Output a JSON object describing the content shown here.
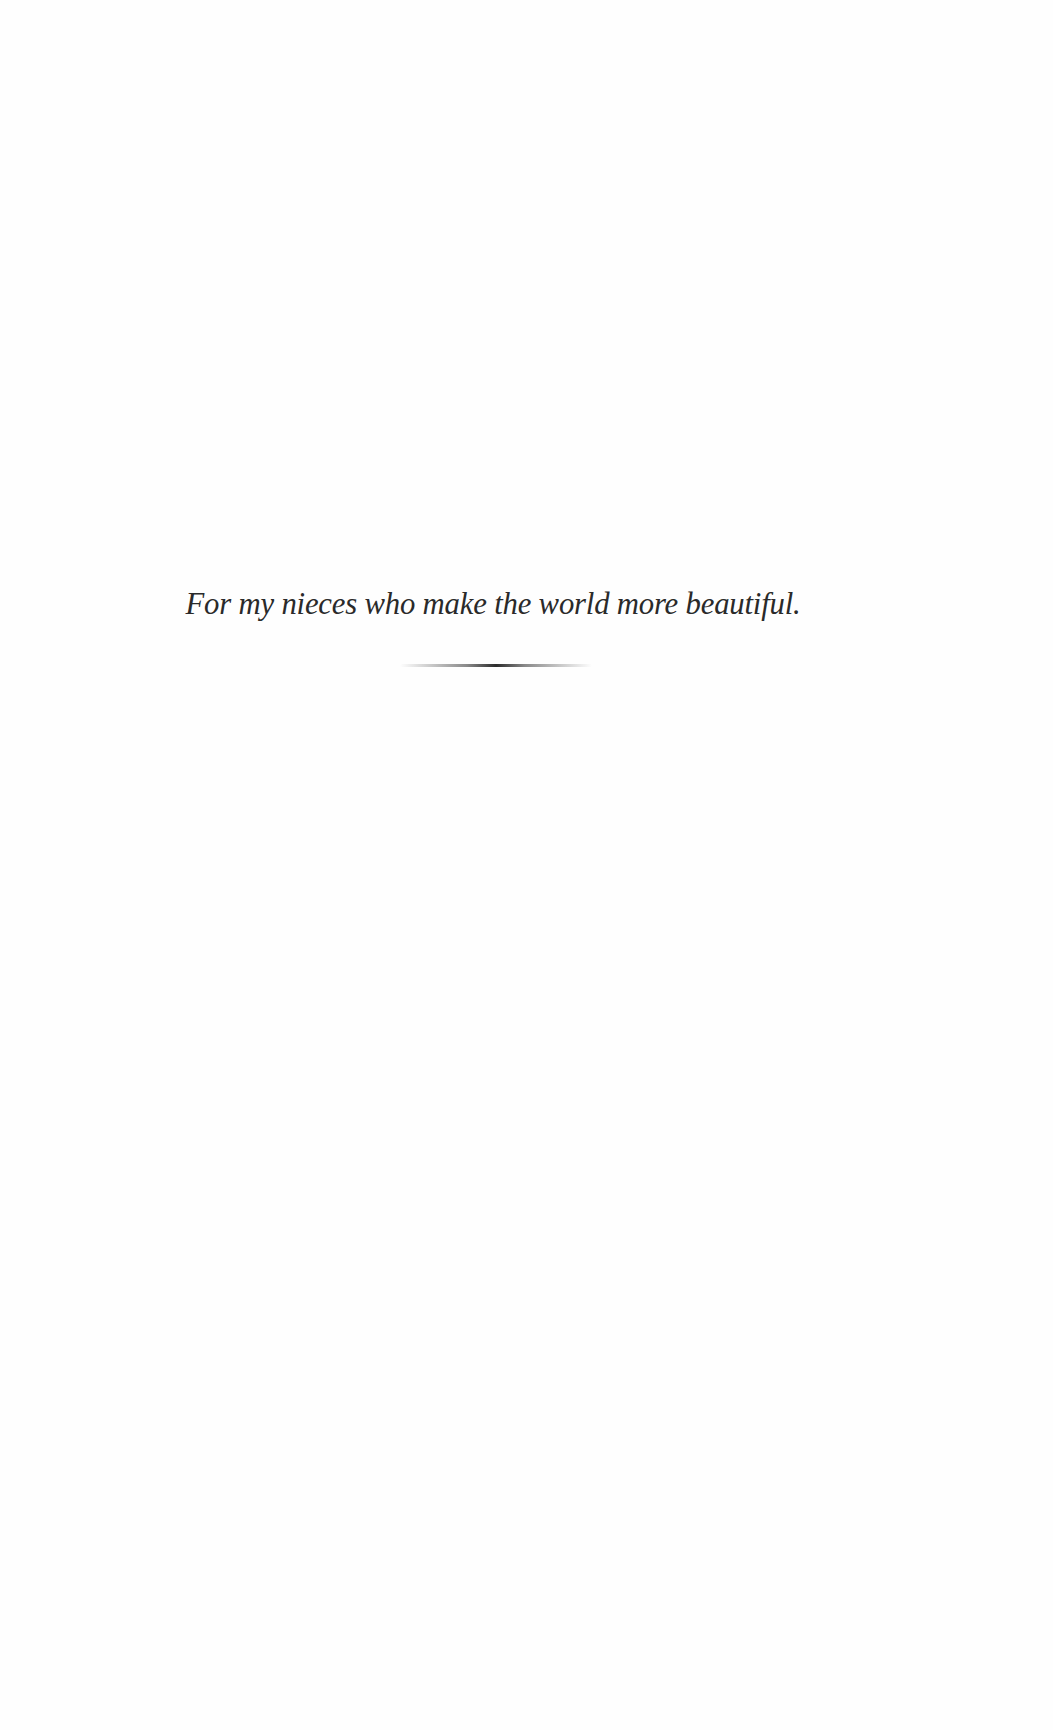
{
  "page": {
    "dedication_text": "For my nieces who make the world more beautiful.",
    "divider": "ornamental-rule"
  }
}
